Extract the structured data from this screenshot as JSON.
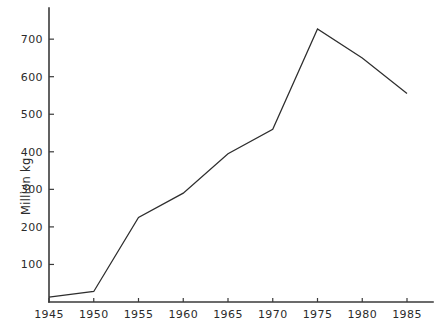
{
  "chart_data": {
    "type": "line",
    "title": "",
    "xlabel": "",
    "ylabel": "Million kg",
    "x": [
      1945,
      1950,
      1955,
      1960,
      1965,
      1970,
      1975,
      1980,
      1985
    ],
    "values": [
      13,
      28,
      225,
      290,
      395,
      460,
      727,
      650,
      555
    ],
    "series": [
      {
        "name": "Million kg",
        "values": [
          13,
          28,
          225,
          290,
          395,
          460,
          727,
          650,
          555
        ]
      }
    ],
    "xtick_labels": [
      "1945",
      "1950",
      "1955",
      "1960",
      "1965",
      "1970",
      "1975",
      "1980",
      "1985"
    ],
    "ytick_labels": [
      "100",
      "200",
      "300",
      "400",
      "500",
      "600",
      "700"
    ],
    "ytick_values": [
      100,
      200,
      300,
      400,
      500,
      600,
      700
    ],
    "xlim": [
      1945,
      1985
    ],
    "ylim": [
      0,
      760
    ],
    "grid": false,
    "legend": false,
    "legend_position": "none",
    "line_color": "#2e2e2e",
    "axis_color": "#3a3a3a",
    "background_color": "#ffffff"
  },
  "axes": {
    "y_axis_label": "Million kg",
    "x_ticks": [
      {
        "label": "1945",
        "value": 1945
      },
      {
        "label": "1950",
        "value": 1950
      },
      {
        "label": "1955",
        "value": 1955
      },
      {
        "label": "1960",
        "value": 1960
      },
      {
        "label": "1965",
        "value": 1965
      },
      {
        "label": "1970",
        "value": 1970
      },
      {
        "label": "1975",
        "value": 1975
      },
      {
        "label": "1980",
        "value": 1980
      },
      {
        "label": "1985",
        "value": 1985
      }
    ],
    "y_ticks": [
      {
        "label": "700",
        "value": 700
      },
      {
        "label": "600",
        "value": 600
      },
      {
        "label": "500",
        "value": 500
      },
      {
        "label": "400",
        "value": 400
      },
      {
        "label": "300",
        "value": 300
      },
      {
        "label": "200",
        "value": 200
      },
      {
        "label": "100",
        "value": 100
      }
    ]
  }
}
